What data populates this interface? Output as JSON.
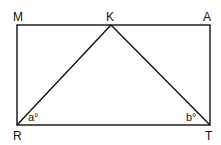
{
  "diagram": {
    "type": "geometry",
    "shape": "rectangle MATR with triangle RKT",
    "points": {
      "M": {
        "label": "M",
        "x": 17,
        "y": 25
      },
      "K": {
        "label": "K",
        "x": 111,
        "y": 25
      },
      "A": {
        "label": "A",
        "x": 210,
        "y": 25
      },
      "R": {
        "label": "R",
        "x": 17,
        "y": 125
      },
      "T": {
        "label": "T",
        "x": 210,
        "y": 125
      }
    },
    "angles": {
      "a": {
        "label": "a°",
        "vertex": "R"
      },
      "b": {
        "label": "b°",
        "vertex": "T"
      }
    },
    "segments": [
      "MA",
      "AT",
      "TR",
      "RM",
      "RK",
      "KT"
    ],
    "line_color": "#111111"
  }
}
